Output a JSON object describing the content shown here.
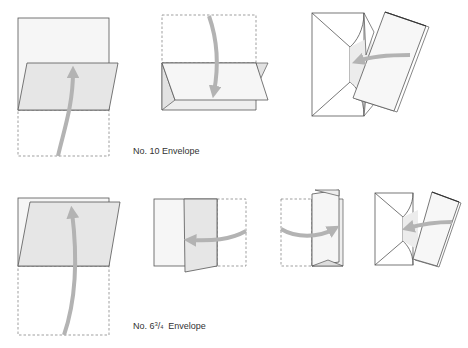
{
  "colors": {
    "line": "#555555",
    "dashed": "#777777",
    "paper_fill": "#f4f4f4",
    "shaded_fill": "#e6e6e6",
    "arrow": "#b3b3b3",
    "text": "#333333"
  },
  "sections": [
    {
      "name": "no-10",
      "label": "No. 10 Envelope",
      "steps": [
        "fold-bottom-third-up",
        "fold-top-third-down",
        "insert-into-envelope"
      ]
    },
    {
      "name": "no-6-3-4",
      "label_prefix": "No. 6",
      "label_sup": "3",
      "label_slash": "/",
      "label_sub": "4",
      "label_suffix": "Envelope",
      "steps": [
        "fold-bottom-half-up",
        "fold-right-third-left",
        "fold-left-third-right",
        "insert-into-envelope"
      ]
    }
  ]
}
